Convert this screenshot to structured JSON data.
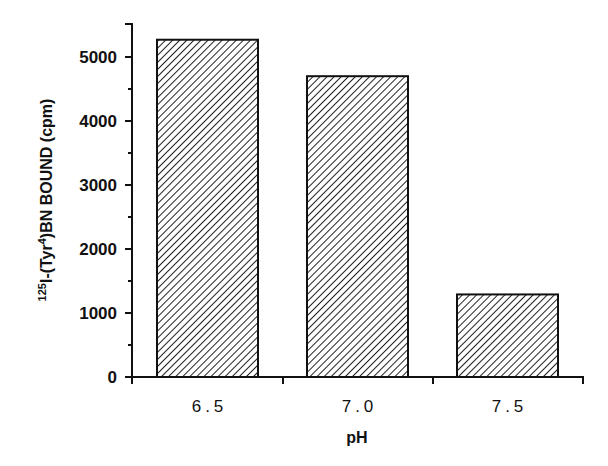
{
  "chart_data": {
    "type": "bar",
    "title": "",
    "categories": [
      "6.5",
      "7.0",
      "7.5"
    ],
    "values": [
      5270,
      4700,
      1290
    ],
    "xlabel": "pH",
    "ylabel": "125I-(Tyr4)BN BOUND (cpm)",
    "ylabel_parts": {
      "sup1": "125",
      "a": "I-(Tyr",
      "sup2": "4",
      "b": ")BN BOUND (cpm)"
    },
    "ylim": [
      0,
      5500
    ],
    "yticks_major": [
      0,
      1000,
      2000,
      3000,
      4000,
      5000
    ],
    "yticks_minor": [
      500,
      1500,
      2500,
      3500,
      4500
    ],
    "grid": false,
    "legend": null,
    "bar_fill": "diagonal-hatch",
    "colors": {
      "stroke": "#111111",
      "background": "#ffffff"
    }
  }
}
